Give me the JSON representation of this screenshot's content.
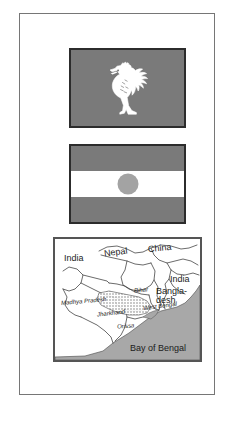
{
  "page": {
    "background_color": "#ffffff",
    "border_color": "#767676"
  },
  "figures": [
    {
      "id": "rooster-flag",
      "type": "flag",
      "subject": "rooster emblem flag",
      "field_color": "#7a7a7a",
      "emblem_color": "#ffffff",
      "emblem_name": "rooster-emblem",
      "border_color": "#2c2c2c"
    },
    {
      "id": "niger-flag",
      "type": "flag",
      "subject": "horizontal triband flag with central disc",
      "stripe_top_color": "#7a7a7a",
      "stripe_middle_color": "#ffffff",
      "stripe_bottom_color": "#7a7a7a",
      "disc_color": "#a3a3a3",
      "border_color": "#2c2c2c"
    },
    {
      "id": "map",
      "type": "map",
      "subject": "eastern India and neighbouring countries",
      "land_color": "#ffffff",
      "sea_color": "#a8a8a8",
      "border_color": "#555555",
      "outline_color": "#3a3a3a"
    }
  ],
  "map": {
    "countries": [
      {
        "key": "india_west",
        "label": "India"
      },
      {
        "key": "nepal",
        "label": "Nepal"
      },
      {
        "key": "china",
        "label": "China"
      },
      {
        "key": "india_east",
        "label": "India"
      },
      {
        "key": "bangladesh",
        "label": "Bangla-\ndesh"
      }
    ],
    "states": [
      {
        "key": "bihar",
        "label": "Bihar"
      },
      {
        "key": "madhya_pradesh",
        "label": "Madhya Pradesh"
      },
      {
        "key": "jharkhand",
        "label": "Jharkhand"
      },
      {
        "key": "west_bengal",
        "label": "West Bengal"
      },
      {
        "key": "orissa",
        "label": "Orissa"
      }
    ],
    "water_bodies": [
      {
        "key": "bay_of_bengal",
        "label": "Bay of Bengal"
      }
    ]
  }
}
